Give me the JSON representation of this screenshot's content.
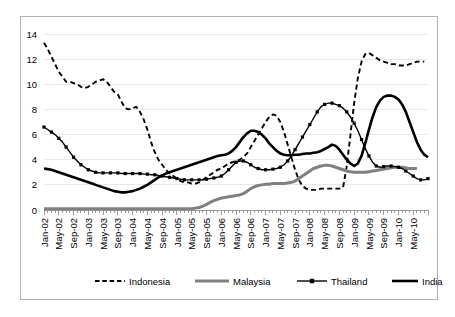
{
  "chart_data": {
    "type": "line",
    "title": "",
    "subtitle": "",
    "xlabel": "",
    "ylabel": "",
    "ylim": [
      0,
      14
    ],
    "yticks": [
      0,
      2,
      4,
      6,
      8,
      10,
      12,
      14
    ],
    "grid": true,
    "legend_position": "bottom",
    "x_tick_labels": [
      "Jan-02",
      "May-02",
      "Sep-02",
      "Jan-03",
      "May-03",
      "Sep-03",
      "Jan-04",
      "May-04",
      "Sep-04",
      "Jan-05",
      "May-05",
      "Sep-05",
      "Jan-06",
      "May-06",
      "Sep-06",
      "Jan-07",
      "May-07",
      "Sep-07",
      "Jan-08",
      "May-08",
      "Sep-08",
      "Jan-09",
      "May-09",
      "Sep-09",
      "Jan-10",
      "May-10"
    ],
    "x_tick_label_rotation": -90,
    "series": [
      {
        "name": "Indonesia",
        "style": "dashed",
        "color": "#000000",
        "width": 1.9,
        "marker": "none",
        "values": [
          13.3,
          12.8,
          12.2,
          11.6,
          11.0,
          10.6,
          10.2,
          10.2,
          10.1,
          10.0,
          9.8,
          9.7,
          9.8,
          10.0,
          10.2,
          10.3,
          10.4,
          10.2,
          9.8,
          9.4,
          9.2,
          8.6,
          8.1,
          8.0,
          8.1,
          8.2,
          7.8,
          7.2,
          6.4,
          5.4,
          4.6,
          4.0,
          3.6,
          3.2,
          2.9,
          2.7,
          2.5,
          2.3,
          2.2,
          2.2,
          2.1,
          2.1,
          2.2,
          2.4,
          2.6,
          2.8,
          3.0,
          3.2,
          3.3,
          3.5,
          3.7,
          3.8,
          3.9,
          4.0,
          4.2,
          4.5,
          5.0,
          5.5,
          6.0,
          6.5,
          7.0,
          7.4,
          7.6,
          7.5,
          7.0,
          6.2,
          5.2,
          4.2,
          3.2,
          2.4,
          1.9,
          1.7,
          1.6,
          1.6,
          1.6,
          1.7,
          1.7,
          1.7,
          1.7,
          1.7,
          1.7,
          1.8,
          3.5,
          6.0,
          8.5,
          10.5,
          11.8,
          12.4,
          12.5,
          12.3,
          12.1,
          11.9,
          11.8,
          11.7,
          11.6,
          11.6,
          11.5,
          11.5,
          11.5,
          11.6,
          11.7,
          11.8,
          11.8,
          11.8
        ]
      },
      {
        "name": "Malaysia",
        "style": "solid",
        "color": "#808080",
        "width": 3.0,
        "marker": "none",
        "values": [
          0.1,
          0.1,
          0.1,
          0.1,
          0.1,
          0.1,
          0.1,
          0.1,
          0.1,
          0.1,
          0.1,
          0.1,
          0.1,
          0.1,
          0.1,
          0.1,
          0.1,
          0.1,
          0.1,
          0.1,
          0.1,
          0.1,
          0.1,
          0.1,
          0.1,
          0.1,
          0.1,
          0.1,
          0.1,
          0.1,
          0.1,
          0.1,
          0.1,
          0.1,
          0.1,
          0.1,
          0.1,
          0.1,
          0.1,
          0.1,
          0.1,
          0.15,
          0.2,
          0.3,
          0.45,
          0.6,
          0.75,
          0.85,
          0.95,
          1.0,
          1.05,
          1.1,
          1.15,
          1.2,
          1.3,
          1.5,
          1.7,
          1.85,
          1.95,
          2.0,
          2.05,
          2.05,
          2.1,
          2.1,
          2.1,
          2.1,
          2.15,
          2.2,
          2.3,
          2.5,
          2.7,
          2.9,
          3.1,
          3.3,
          3.4,
          3.5,
          3.55,
          3.55,
          3.5,
          3.4,
          3.3,
          3.2,
          3.1,
          3.05,
          3.0,
          3.0,
          3.0,
          3.0,
          3.05,
          3.1,
          3.15,
          3.2,
          3.25,
          3.3,
          3.35,
          3.4,
          3.4,
          3.4,
          3.35,
          3.3,
          3.3,
          3.3
        ]
      },
      {
        "name": "Thailand",
        "style": "solid-marker",
        "color": "#000000",
        "width": 1.4,
        "marker": "square",
        "values": [
          6.6,
          6.4,
          6.2,
          6.0,
          5.7,
          5.4,
          5.0,
          4.6,
          4.2,
          3.9,
          3.6,
          3.4,
          3.2,
          3.1,
          3.0,
          2.95,
          2.95,
          2.95,
          2.95,
          2.95,
          2.95,
          2.9,
          2.9,
          2.9,
          2.9,
          2.9,
          2.9,
          2.85,
          2.85,
          2.8,
          2.8,
          2.75,
          2.7,
          2.65,
          2.6,
          2.55,
          2.5,
          2.45,
          2.4,
          2.4,
          2.4,
          2.4,
          2.4,
          2.4,
          2.45,
          2.5,
          2.55,
          2.6,
          2.7,
          2.9,
          3.2,
          3.5,
          3.8,
          3.9,
          3.9,
          3.8,
          3.6,
          3.4,
          3.3,
          3.2,
          3.2,
          3.2,
          3.25,
          3.3,
          3.4,
          3.6,
          3.9,
          4.3,
          4.8,
          5.3,
          5.8,
          6.3,
          6.8,
          7.3,
          7.8,
          8.2,
          8.4,
          8.5,
          8.5,
          8.4,
          8.3,
          8.1,
          7.8,
          7.4,
          6.9,
          6.3,
          5.6,
          4.9,
          4.3,
          3.8,
          3.5,
          3.4,
          3.45,
          3.5,
          3.5,
          3.45,
          3.4,
          3.3,
          3.1,
          2.9,
          2.7,
          2.5,
          2.4,
          2.4,
          2.5
        ]
      },
      {
        "name": "India",
        "style": "solid",
        "color": "#000000",
        "width": 2.6,
        "marker": "none",
        "values": [
          3.3,
          3.25,
          3.2,
          3.1,
          3.0,
          2.9,
          2.8,
          2.7,
          2.6,
          2.5,
          2.4,
          2.3,
          2.2,
          2.1,
          2.0,
          1.9,
          1.8,
          1.7,
          1.6,
          1.5,
          1.45,
          1.4,
          1.4,
          1.45,
          1.5,
          1.6,
          1.7,
          1.85,
          2.0,
          2.2,
          2.4,
          2.6,
          2.75,
          2.9,
          3.0,
          3.1,
          3.2,
          3.3,
          3.4,
          3.5,
          3.6,
          3.7,
          3.8,
          3.9,
          4.0,
          4.1,
          4.2,
          4.3,
          4.35,
          4.4,
          4.5,
          4.7,
          5.0,
          5.4,
          5.8,
          6.1,
          6.3,
          6.3,
          6.2,
          6.0,
          5.7,
          5.3,
          5.0,
          4.7,
          4.5,
          4.4,
          4.35,
          4.35,
          4.4,
          4.4,
          4.45,
          4.5,
          4.5,
          4.55,
          4.6,
          4.7,
          4.85,
          5.0,
          5.2,
          5.1,
          4.8,
          4.4,
          4.0,
          3.7,
          3.5,
          3.7,
          4.3,
          5.3,
          6.4,
          7.4,
          8.2,
          8.7,
          9.0,
          9.1,
          9.1,
          9.0,
          8.8,
          8.4,
          7.8,
          7.0,
          6.2,
          5.4,
          4.8,
          4.4,
          4.2
        ]
      }
    ]
  },
  "legend": {
    "items": [
      {
        "label": "Indonesia",
        "swatch": "dashed-line-swatch"
      },
      {
        "label": "Malaysia",
        "swatch": "thick-gray-line-swatch"
      },
      {
        "label": "Thailand",
        "swatch": "marker-line-swatch"
      },
      {
        "label": "India",
        "swatch": "thick-black-line-swatch"
      }
    ]
  },
  "colors": {
    "indonesia": "#000000",
    "malaysia": "#808080",
    "thailand": "#000000",
    "india": "#000000",
    "gridline": "#e8e8e8",
    "axis": "#9a9a9a",
    "frame": "#b3b3b3",
    "background": "#ffffff"
  }
}
